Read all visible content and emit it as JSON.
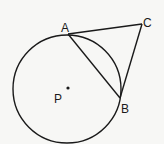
{
  "diagram": {
    "type": "geometry",
    "labels": {
      "A": "A",
      "B": "B",
      "C": "C",
      "P": "P"
    },
    "points": {
      "P": [
        67,
        89
      ],
      "A": [
        68,
        34
      ],
      "B": [
        120,
        98
      ],
      "C": [
        142,
        24
      ]
    },
    "circle": {
      "center": "P",
      "radius": 54
    },
    "segments": [
      [
        "A",
        "C"
      ],
      [
        "B",
        "C"
      ],
      [
        "A",
        "B"
      ]
    ],
    "stroke_color": "#1a1a1a",
    "background_color": "#f7f7f5"
  }
}
